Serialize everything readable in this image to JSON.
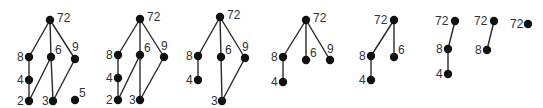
{
  "colors": {
    "node": "#111111",
    "edge": "#2a2a2a",
    "label": "#333333",
    "background": "#ffffff"
  },
  "panels": [
    {
      "id": "panel-1",
      "nodes": [
        {
          "label": "72",
          "x": 50,
          "y": 20,
          "lx": 57,
          "ly": 22
        },
        {
          "label": "8",
          "x": 29,
          "y": 57,
          "lx": 17,
          "ly": 61
        },
        {
          "label": "6",
          "x": 51,
          "y": 57,
          "lx": 55,
          "ly": 54
        },
        {
          "label": "9",
          "x": 75,
          "y": 59,
          "lx": 72,
          "ly": 51
        },
        {
          "label": "4",
          "x": 29,
          "y": 80,
          "lx": 17,
          "ly": 84
        },
        {
          "label": "2",
          "x": 29,
          "y": 101,
          "lx": 17,
          "ly": 105
        },
        {
          "label": "3",
          "x": 53,
          "y": 101,
          "lx": 42,
          "ly": 105
        },
        {
          "label": "5",
          "x": 75,
          "y": 100,
          "lx": 79,
          "ly": 97
        }
      ],
      "edges": [
        [
          "72",
          "8"
        ],
        [
          "72",
          "6"
        ],
        [
          "72",
          "9"
        ],
        [
          "8",
          "4"
        ],
        [
          "4",
          "2"
        ],
        [
          "6",
          "2"
        ],
        [
          "6",
          "3"
        ],
        [
          "9",
          "3"
        ]
      ]
    },
    {
      "id": "panel-2",
      "nodes": [
        {
          "label": "72",
          "x": 140,
          "y": 19,
          "lx": 147,
          "ly": 21
        },
        {
          "label": "8",
          "x": 118,
          "y": 55,
          "lx": 106,
          "ly": 59
        },
        {
          "label": "6",
          "x": 140,
          "y": 55,
          "lx": 144,
          "ly": 52
        },
        {
          "label": "9",
          "x": 164,
          "y": 57,
          "lx": 161,
          "ly": 50
        },
        {
          "label": "4",
          "x": 118,
          "y": 78,
          "lx": 106,
          "ly": 82
        },
        {
          "label": "2",
          "x": 118,
          "y": 100,
          "lx": 106,
          "ly": 104
        },
        {
          "label": "3",
          "x": 140,
          "y": 100,
          "lx": 129,
          "ly": 104
        }
      ],
      "edges": [
        [
          "72",
          "8"
        ],
        [
          "72",
          "6"
        ],
        [
          "72",
          "9"
        ],
        [
          "8",
          "4"
        ],
        [
          "4",
          "2"
        ],
        [
          "6",
          "2"
        ],
        [
          "6",
          "3"
        ],
        [
          "9",
          "3"
        ]
      ]
    },
    {
      "id": "panel-3",
      "nodes": [
        {
          "label": "72",
          "x": 220,
          "y": 17,
          "lx": 227,
          "ly": 19
        },
        {
          "label": "8",
          "x": 198,
          "y": 56,
          "lx": 186,
          "ly": 60
        },
        {
          "label": "6",
          "x": 221,
          "y": 57,
          "lx": 225,
          "ly": 54
        },
        {
          "label": "9",
          "x": 245,
          "y": 58,
          "lx": 242,
          "ly": 51
        },
        {
          "label": "4",
          "x": 198,
          "y": 80,
          "lx": 186,
          "ly": 84
        },
        {
          "label": "3",
          "x": 222,
          "y": 101,
          "lx": 211,
          "ly": 105
        }
      ],
      "edges": [
        [
          "72",
          "8"
        ],
        [
          "72",
          "6"
        ],
        [
          "72",
          "9"
        ],
        [
          "8",
          "4"
        ],
        [
          "6",
          "3"
        ],
        [
          "9",
          "3"
        ]
      ]
    },
    {
      "id": "panel-4",
      "nodes": [
        {
          "label": "72",
          "x": 306,
          "y": 20,
          "lx": 313,
          "ly": 22
        },
        {
          "label": "8",
          "x": 283,
          "y": 57,
          "lx": 271,
          "ly": 61
        },
        {
          "label": "6",
          "x": 306,
          "y": 60,
          "lx": 310,
          "ly": 57
        },
        {
          "label": "9",
          "x": 330,
          "y": 60,
          "lx": 327,
          "ly": 53
        },
        {
          "label": "4",
          "x": 283,
          "y": 82,
          "lx": 271,
          "ly": 86
        }
      ],
      "edges": [
        [
          "72",
          "8"
        ],
        [
          "72",
          "6"
        ],
        [
          "72",
          "9"
        ],
        [
          "8",
          "4"
        ]
      ]
    },
    {
      "id": "panel-5",
      "nodes": [
        {
          "label": "72",
          "x": 394,
          "y": 20,
          "lx": 374,
          "ly": 24
        },
        {
          "label": "8",
          "x": 371,
          "y": 56,
          "lx": 359,
          "ly": 60
        },
        {
          "label": "6",
          "x": 394,
          "y": 57,
          "lx": 398,
          "ly": 54
        },
        {
          "label": "4",
          "x": 371,
          "y": 80,
          "lx": 359,
          "ly": 84
        }
      ],
      "edges": [
        [
          "72",
          "8"
        ],
        [
          "72",
          "6"
        ],
        [
          "8",
          "4"
        ]
      ]
    },
    {
      "id": "panel-6",
      "nodes": [
        {
          "label": "72",
          "x": 455,
          "y": 21,
          "lx": 435,
          "ly": 25
        },
        {
          "label": "8",
          "x": 448,
          "y": 49,
          "lx": 436,
          "ly": 53
        },
        {
          "label": "4",
          "x": 448,
          "y": 74,
          "lx": 436,
          "ly": 78
        }
      ],
      "edges": [
        [
          "72",
          "8"
        ],
        [
          "8",
          "4"
        ]
      ]
    },
    {
      "id": "panel-7",
      "nodes": [
        {
          "label": "72",
          "x": 494,
          "y": 21,
          "lx": 474,
          "ly": 25
        },
        {
          "label": "8",
          "x": 487,
          "y": 50,
          "lx": 475,
          "ly": 54
        }
      ],
      "edges": [
        [
          "72",
          "8"
        ]
      ]
    },
    {
      "id": "panel-8",
      "nodes": [
        {
          "label": "72",
          "x": 528,
          "y": 24,
          "lx": 510,
          "ly": 28
        }
      ],
      "edges": []
    }
  ]
}
